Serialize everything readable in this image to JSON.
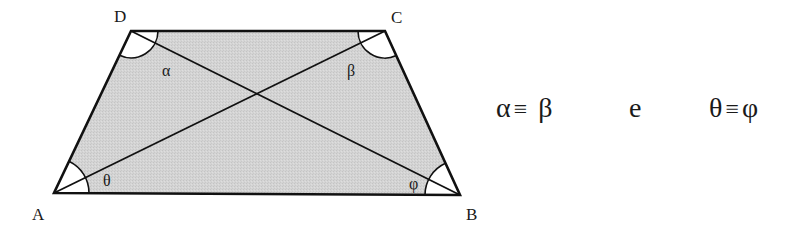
{
  "diagram": {
    "title": "",
    "shape": "isosceles trapezoid",
    "fill_color": "#d2d2d2",
    "stroke_color": "#111111",
    "vertices": {
      "A": {
        "label": "A",
        "x": 54,
        "y": 193
      },
      "B": {
        "label": "B",
        "x": 460,
        "y": 195
      },
      "C": {
        "label": "C",
        "x": 385,
        "y": 31
      },
      "D": {
        "label": "D",
        "x": 131,
        "y": 31
      }
    },
    "diagonals": [
      "AC",
      "BD"
    ],
    "intersection": {
      "x": 257,
      "y": 94
    },
    "angles": {
      "alpha": {
        "symbol": "α",
        "at_vertex": "D",
        "between": "DA-DB"
      },
      "beta": {
        "symbol": "β",
        "at_vertex": "C",
        "between": "CB-CA"
      },
      "theta": {
        "symbol": "θ",
        "at_vertex": "A",
        "between": "AB-AC"
      },
      "phi": {
        "symbol": "φ",
        "at_vertex": "B",
        "between": "BA-BD"
      }
    }
  },
  "relation": {
    "left": {
      "a": "α",
      "op": "≡",
      "b": "β"
    },
    "conjunction": "e",
    "right": {
      "a": "θ",
      "op": "≡",
      "b": "φ"
    }
  }
}
